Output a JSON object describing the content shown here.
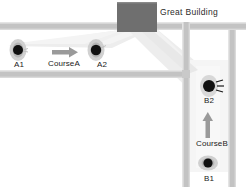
{
  "diagram": {
    "title_visible": false,
    "canvas": {
      "width": 246,
      "height": 187,
      "background": "#ffffff"
    },
    "colors": {
      "road_fill": "#c3c3c3",
      "road_edge_light": "#e2e2e2",
      "building_fill": "#6f6f6f",
      "beam_fill": "#ededed",
      "beam_fill_soft": "#f2f2f2",
      "marker_core": "#111111",
      "marker_halo": "#c9c9c9",
      "arrow": "#9a9a9a",
      "text": "#1a1a1a"
    },
    "building": {
      "name": "Great Building",
      "label": "Great Building",
      "icon": "building-block"
    },
    "markers": [
      {
        "id": "A1",
        "label": "A1",
        "icon": "vehicle-marker",
        "emits_signal": false
      },
      {
        "id": "A2",
        "label": "A2",
        "icon": "vehicle-marker",
        "emits_signal": false
      },
      {
        "id": "B2",
        "label": "B2",
        "icon": "vehicle-marker",
        "emits_signal": true
      },
      {
        "id": "B1",
        "label": "B1",
        "icon": "vehicle-marker",
        "emits_signal": false
      }
    ],
    "courses": [
      {
        "id": "CourseA",
        "label": "CourseA",
        "arrow_direction": "right",
        "from": "A1",
        "to": "A2"
      },
      {
        "id": "CourseB",
        "label": "CourseB",
        "arrow_direction": "up",
        "from": "B1",
        "to": "B2"
      }
    ],
    "roads": [
      {
        "id": "road-horizontal-upper",
        "orientation": "horizontal"
      },
      {
        "id": "road-horizontal-lower",
        "orientation": "horizontal"
      },
      {
        "id": "road-vertical-right",
        "orientation": "vertical"
      }
    ],
    "beams": [
      {
        "id": "beam-to-course-a",
        "from": "Great Building",
        "toward": "CourseA"
      },
      {
        "id": "beam-to-course-b",
        "from": "Great Building",
        "toward": "CourseB"
      }
    ]
  }
}
